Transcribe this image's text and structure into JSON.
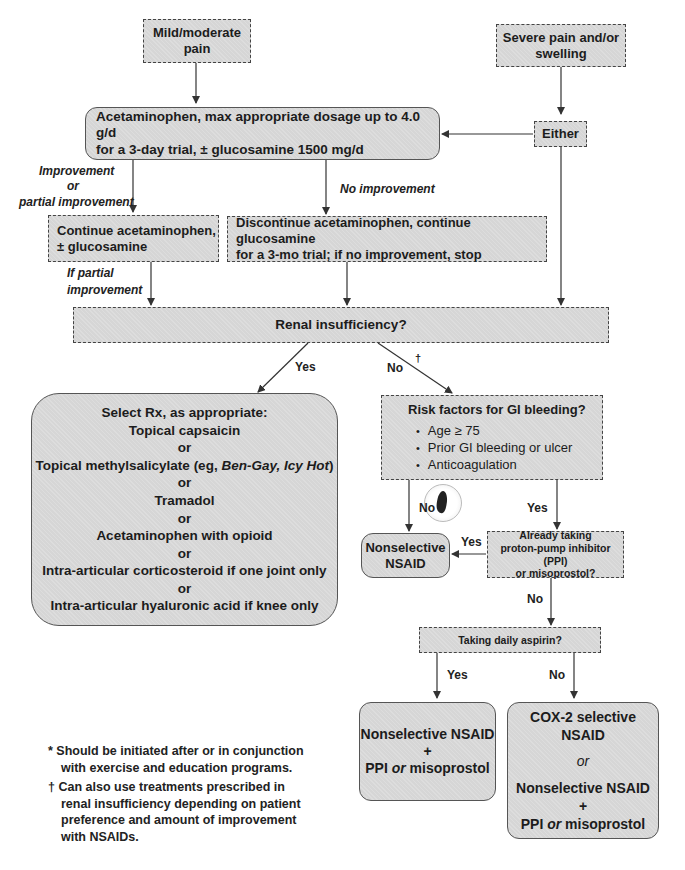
{
  "nodes": {
    "mild_pain": {
      "line1": "Mild/moderate",
      "line2": "pain"
    },
    "severe_pain": {
      "line1": "Severe pain and/or",
      "line2": "swelling"
    },
    "acetaminophen_trial": {
      "line1": "Acetaminophen, max appropriate dosage up to 4.0 g/d",
      "line2": "for a 3-day trial, ± glucosamine 1500 mg/d"
    },
    "either": {
      "text": "Either"
    },
    "continue_acetaminophen": {
      "line1": "Continue acetaminophen,",
      "line2": "± glucosamine"
    },
    "discontinue_acetaminophen": {
      "line1": "Discontinue acetaminophen, continue glucosamine",
      "line2": "for a 3-mo trial; if no improvement, stop"
    },
    "renal_insufficiency": {
      "text": "Renal insufficiency?"
    },
    "select_rx": {
      "title": "Select Rx, as appropriate:",
      "options": [
        "Topical capsaicin",
        "Topical methylsalicylate (eg, ",
        "Tramadol",
        "Acetaminophen with opioid",
        "Intra-articular corticosteroid if one joint only",
        "Intra-articular hyaluronic acid if knee only"
      ],
      "brand_names": "Ben-Gay, Icy Hot",
      "close_paren": ")",
      "separator": "or"
    },
    "gi_risk": {
      "title": "Risk factors for GI bleeding?",
      "bullets": [
        "Age ≥ 75",
        "Prior GI bleeding or ulcer",
        "Anticoagulation"
      ]
    },
    "nonselective_nsaid": {
      "line1": "Nonselective",
      "line2": "NSAID"
    },
    "already_ppi": {
      "line1": "Already taking",
      "line2": "proton-pump inhibitor (PPI)",
      "line3": "or misoprostol?"
    },
    "daily_aspirin": {
      "text": "Taking daily aspirin?"
    },
    "nsaid_plus_ppi": {
      "line1": "Nonselective NSAID",
      "plus": "+",
      "ppi": "PPI ",
      "or": "or",
      "miso": " misoprostol"
    },
    "cox2_or": {
      "line1": "COX-2 selective NSAID",
      "or": "or",
      "line2": "Nonselective NSAID",
      "plus": "+",
      "ppi": "PPI ",
      "or2": "or",
      "miso": " misoprostol"
    }
  },
  "edge_labels": {
    "improvement": "Improvement",
    "or": "or",
    "partial_improvement": "partial improvement",
    "no_improvement": "No improvement",
    "if_partial": "If partial",
    "improvement2": "improvement",
    "renal_yes": "Yes",
    "renal_no": "No",
    "dagger": "†",
    "gi_no": "No",
    "gi_yes": "Yes",
    "ppi_yes": "Yes",
    "ppi_no": "No",
    "aspirin_yes": "Yes",
    "aspirin_no": "No"
  },
  "footnotes": {
    "star_mark": "*",
    "star_line1": "Should be initiated after or in conjunction",
    "star_line2": "with exercise and education programs.",
    "dagger_mark": "†",
    "dagger_line1": "Can also use treatments prescribed in",
    "dagger_line2": "renal insufficiency depending on patient",
    "dagger_line3": "preference and amount of improvement",
    "dagger_line4": "with NSAIDs."
  }
}
